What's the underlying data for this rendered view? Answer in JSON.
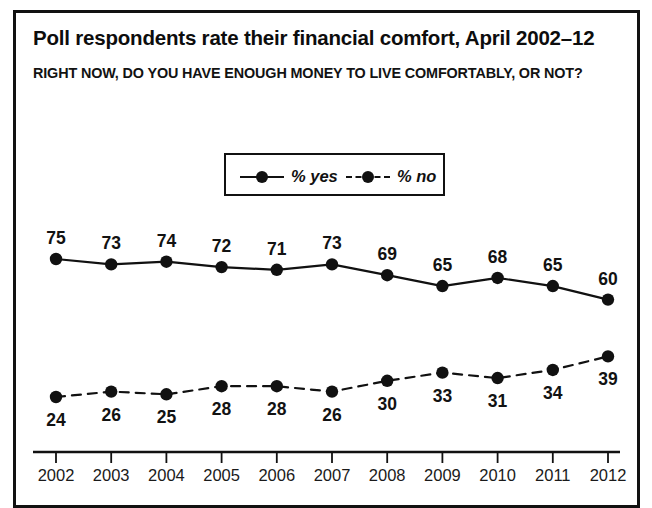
{
  "header": {
    "title": "Poll respondents rate their financial comfort, April 2002–12",
    "subtitle": "RIGHT NOW, DO YOU HAVE ENOUGH MONEY TO LIVE COMFORTABLY, OR NOT?"
  },
  "legend": {
    "items": [
      {
        "label": "% yes",
        "style": "solid",
        "marker": "circle"
      },
      {
        "label": "% no",
        "style": "dashed",
        "marker": "circle"
      }
    ]
  },
  "colors": {
    "line": "#111111",
    "marker": "#111111",
    "text": "#121212",
    "frame": "#111111",
    "background": "#ffffff"
  },
  "chart_data": {
    "type": "line",
    "title": "Poll respondents rate their financial comfort, April 2002–12",
    "subtitle": "RIGHT NOW, DO YOU HAVE ENOUGH MONEY TO LIVE COMFORTABLY, OR NOT?",
    "xlabel": "",
    "ylabel": "",
    "categories": [
      "2002",
      "2003",
      "2004",
      "2005",
      "2006",
      "2007",
      "2008",
      "2009",
      "2010",
      "2011",
      "2012"
    ],
    "x": [
      2002,
      2003,
      2004,
      2005,
      2006,
      2007,
      2008,
      2009,
      2010,
      2011,
      2012
    ],
    "ylim": [
      0,
      100
    ],
    "grid": false,
    "legend_position": "top-center",
    "data_labels": true,
    "series": [
      {
        "name": "% yes",
        "style": "solid",
        "label_position": "above",
        "values": [
          75,
          73,
          74,
          72,
          71,
          73,
          69,
          65,
          68,
          65,
          60
        ]
      },
      {
        "name": "% no",
        "style": "dashed",
        "label_position": "below",
        "values": [
          24,
          26,
          25,
          28,
          28,
          26,
          30,
          33,
          31,
          34,
          39
        ]
      }
    ]
  }
}
